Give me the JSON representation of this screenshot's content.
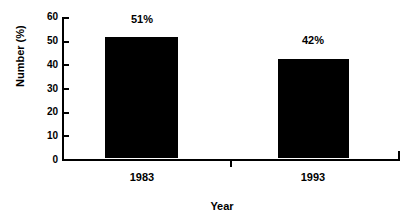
{
  "chart_data": {
    "type": "bar",
    "title": "",
    "subtitle": "",
    "xlabel": "Year",
    "ylabel": "Number (%)",
    "categories": [
      "1983",
      "1993"
    ],
    "values": [
      51,
      42
    ],
    "data_labels": [
      "51%",
      "42%"
    ],
    "ylim": [
      0,
      60
    ],
    "yticks": [
      0,
      10,
      20,
      30,
      40,
      50,
      60
    ],
    "ytick_labels": [
      "0",
      "10",
      "20",
      "30",
      "40",
      "50",
      "60"
    ],
    "grid": false,
    "legend": null,
    "series": [
      {
        "name": "",
        "values": [
          51,
          42
        ]
      }
    ],
    "colors": {
      "bar_fill": "#000000",
      "axis": "#000000",
      "text": "#000000",
      "background": "#ffffff"
    }
  }
}
